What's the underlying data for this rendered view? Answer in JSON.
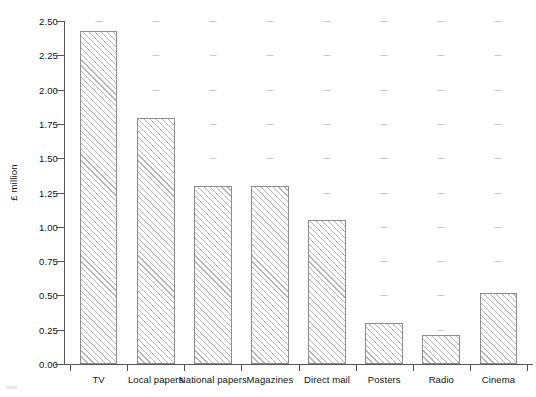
{
  "chart_data": {
    "type": "bar",
    "title": "",
    "xlabel": "",
    "ylabel": "£ million",
    "categories": [
      "TV",
      "Local papers",
      "National papers",
      "Magazines",
      "Direct mail",
      "Posters",
      "Radio",
      "Cinema"
    ],
    "values": [
      2.43,
      1.79,
      1.3,
      1.3,
      1.05,
      0.3,
      0.21,
      0.52
    ],
    "ylim": [
      0.0,
      2.5
    ],
    "ytick_labels": [
      "0.00",
      "0.25",
      "0.50",
      "0.75",
      "1.00",
      "1.25",
      "1.50",
      "1.75",
      "2.00",
      "2.25",
      "2.50"
    ],
    "ytick_values": [
      0.0,
      0.25,
      0.5,
      0.75,
      1.0,
      1.25,
      1.5,
      1.75,
      2.0,
      2.25,
      2.5
    ],
    "grid": "faint-dash-marks",
    "legend": null,
    "bar_fill": "diagonal-hatch",
    "bar_edge_color": "#8d8d8d",
    "hatch_color": "#b4b4b4",
    "axis_color": "#555555",
    "background_color": "#ffffff"
  }
}
